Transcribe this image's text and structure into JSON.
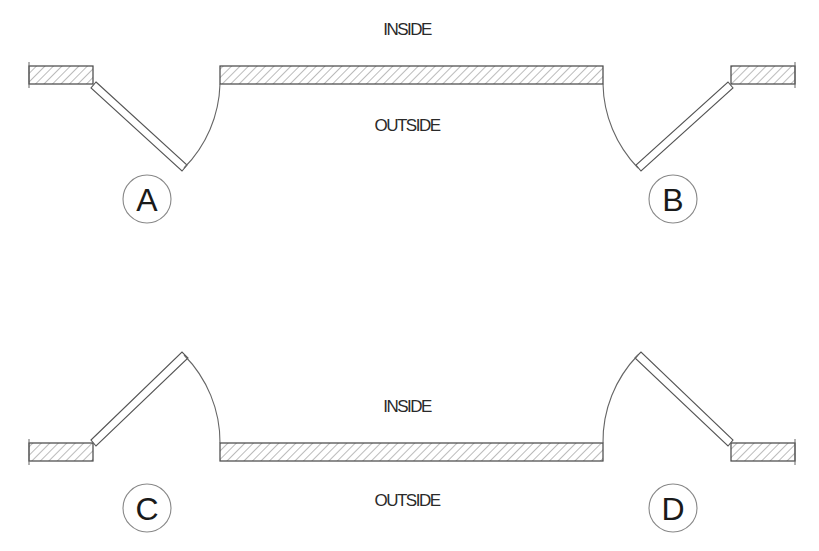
{
  "diagram": {
    "top_panel": {
      "inside_label": "INSIDE",
      "outside_label": "OUTSIDE",
      "doors": [
        {
          "id": "A",
          "label": "A",
          "hinge": "left",
          "swing": "outward"
        },
        {
          "id": "B",
          "label": "B",
          "hinge": "right",
          "swing": "outward"
        }
      ]
    },
    "bottom_panel": {
      "inside_label": "INSIDE",
      "outside_label": "OUTSIDE",
      "doors": [
        {
          "id": "C",
          "label": "C",
          "hinge": "left",
          "swing": "inward"
        },
        {
          "id": "D",
          "label": "D",
          "hinge": "right",
          "swing": "inward"
        }
      ]
    },
    "colors": {
      "line": "#444444",
      "hatch": "#777777",
      "background": "#ffffff"
    }
  }
}
